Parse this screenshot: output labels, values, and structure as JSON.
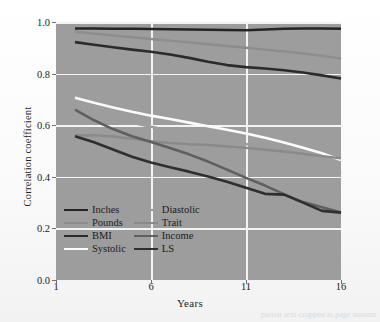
{
  "figure": {
    "background_color": "#fdfdfd",
    "panel_color": "#9d9d9d",
    "gridline_color": "#f4f4f4"
  },
  "axes": {
    "x_title": "Years",
    "y_title": "Correlation coefficient",
    "x_ticks": [
      "1",
      "6",
      "11",
      "16"
    ],
    "y_ticks": [
      "0.0",
      "0.2",
      "0.4",
      "0.6",
      "0.8",
      "1.0"
    ]
  },
  "legend": {
    "column_left": [
      {
        "label": "Inches",
        "color": "#242424"
      },
      {
        "label": "Pounds",
        "color": "#8d8d8d"
      },
      {
        "label": "BMI",
        "color": "#2b2b2b"
      },
      {
        "label": "Systolic",
        "color": "#fbfbfb"
      }
    ],
    "column_right": [
      {
        "label": "Diastolic",
        "color": "#9d9d9d"
      },
      {
        "label": "Trait",
        "color": "#8a8a8a"
      },
      {
        "label": "Income",
        "color": "#5f5f5f"
      },
      {
        "label": "LS",
        "color": "#2f2f2f"
      }
    ]
  },
  "caption": {
    "cropped_text_fragment": "partial text cropped at page bottom"
  },
  "chart_data": {
    "type": "line",
    "title": "",
    "xlabel": "Years",
    "ylabel": "Correlation coefficient",
    "xlim": [
      1,
      16
    ],
    "ylim": [
      0.0,
      1.0
    ],
    "xticks": [
      1,
      6,
      11,
      16
    ],
    "yticks": [
      0.0,
      0.2,
      0.4,
      0.6,
      0.8,
      1.0
    ],
    "grid": true,
    "legend_position": "lower-left inside axes",
    "x": [
      2,
      3,
      4,
      5,
      6,
      7,
      8,
      9,
      10,
      11,
      12,
      13,
      14,
      15,
      16
    ],
    "series": [
      {
        "name": "Inches",
        "color": "#242424",
        "width": 2.4,
        "values": [
          0.975,
          0.975,
          0.974,
          0.974,
          0.973,
          0.972,
          0.971,
          0.97,
          0.969,
          0.968,
          0.971,
          0.974,
          0.975,
          0.975,
          0.974
        ]
      },
      {
        "name": "Pounds",
        "color": "#8d8d8d",
        "width": 2.4,
        "values": [
          0.962,
          0.955,
          0.948,
          0.941,
          0.934,
          0.928,
          0.921,
          0.914,
          0.907,
          0.9,
          0.893,
          0.886,
          0.878,
          0.869,
          0.858
        ]
      },
      {
        "name": "BMI",
        "color": "#2b2b2b",
        "width": 2.6,
        "values": [
          0.922,
          0.912,
          0.902,
          0.893,
          0.885,
          0.874,
          0.861,
          0.846,
          0.833,
          0.825,
          0.82,
          0.813,
          0.804,
          0.793,
          0.781
        ]
      },
      {
        "name": "Systolic",
        "color": "#fbfbfb",
        "width": 2.6,
        "values": [
          0.706,
          0.687,
          0.669,
          0.652,
          0.637,
          0.624,
          0.61,
          0.596,
          0.582,
          0.568,
          0.551,
          0.533,
          0.513,
          0.491,
          0.465
        ]
      },
      {
        "name": "Diastolic",
        "color": "#9d9d9d",
        "width": 2.4,
        "values": [
          0.668,
          0.646,
          0.626,
          0.609,
          0.594,
          0.58,
          0.566,
          0.553,
          0.54,
          0.527,
          0.512,
          0.496,
          0.477,
          0.456,
          0.412
        ]
      },
      {
        "name": "Trait",
        "color": "#8a8a8a",
        "width": 2.4,
        "values": [
          0.56,
          0.561,
          0.556,
          0.547,
          0.538,
          0.531,
          0.526,
          0.523,
          0.518,
          0.512,
          0.505,
          0.498,
          0.489,
          0.48,
          0.472
        ]
      },
      {
        "name": "Income",
        "color": "#5f5f5f",
        "width": 2.6,
        "values": [
          0.66,
          0.619,
          0.585,
          0.557,
          0.535,
          0.512,
          0.487,
          0.459,
          0.428,
          0.396,
          0.366,
          0.333,
          0.302,
          0.282,
          0.262
        ]
      },
      {
        "name": "LS",
        "color": "#2f2f2f",
        "width": 2.6,
        "values": [
          0.557,
          0.534,
          0.506,
          0.478,
          0.455,
          0.437,
          0.42,
          0.401,
          0.381,
          0.358,
          0.334,
          0.331,
          0.3,
          0.268,
          0.261
        ]
      }
    ]
  }
}
